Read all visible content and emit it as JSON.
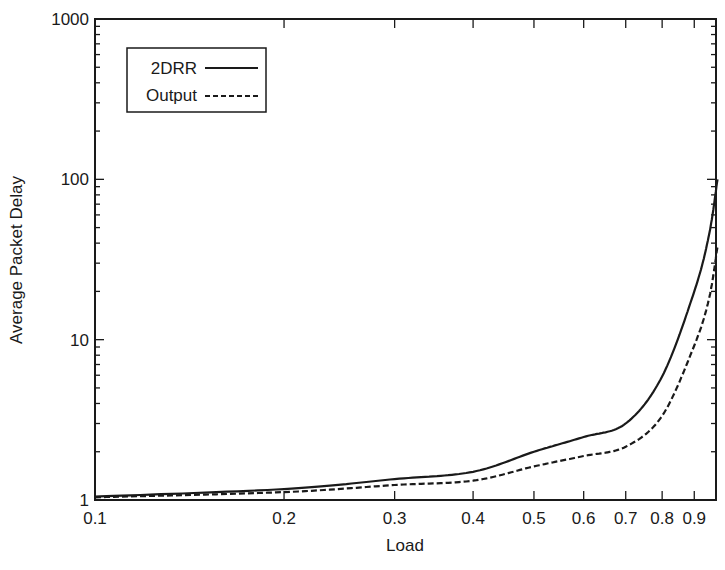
{
  "chart_data": {
    "type": "line",
    "title": "",
    "xlabel": "Load",
    "ylabel": "Average Packet Delay",
    "xscale": "log",
    "yscale": "log",
    "xlim": [
      0.1,
      0.98
    ],
    "ylim": [
      1,
      1000
    ],
    "grid": false,
    "legend_position": "upper-left",
    "x_ticks": [
      {
        "value": 0.1,
        "label": "0.1"
      },
      {
        "value": 0.2,
        "label": "0.2"
      },
      {
        "value": 0.3,
        "label": "0.3"
      },
      {
        "value": 0.4,
        "label": "0.4"
      },
      {
        "value": 0.5,
        "label": "0.5"
      },
      {
        "value": 0.6,
        "label": "0.6"
      },
      {
        "value": 0.7,
        "label": "0.7"
      },
      {
        "value": 0.8,
        "label": "0.8"
      },
      {
        "value": 0.9,
        "label": "0.9"
      }
    ],
    "y_ticks": [
      {
        "value": 1,
        "label": "1"
      },
      {
        "value": 10,
        "label": "10"
      },
      {
        "value": 100,
        "label": "100"
      },
      {
        "value": 1000,
        "label": "1000"
      }
    ],
    "x": [
      0.1,
      0.2,
      0.3,
      0.4,
      0.5,
      0.6,
      0.7,
      0.8,
      0.9,
      0.95,
      0.98
    ],
    "series": [
      {
        "name": "2DRR",
        "style": "solid",
        "values": [
          1.05,
          1.17,
          1.35,
          1.5,
          2.0,
          2.47,
          3.0,
          5.9,
          20,
          45,
          100
        ]
      },
      {
        "name": "Output",
        "style": "dashed",
        "values": [
          1.04,
          1.12,
          1.24,
          1.32,
          1.62,
          1.88,
          2.15,
          3.35,
          9.2,
          18,
          38
        ]
      }
    ]
  }
}
